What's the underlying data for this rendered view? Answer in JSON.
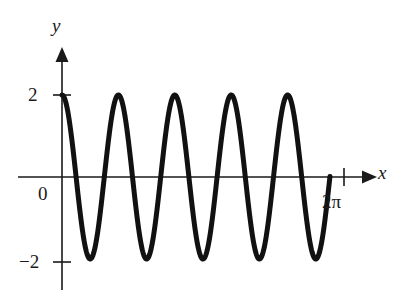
{
  "figure": {
    "axis_labels": {
      "x": "x",
      "y": "y"
    },
    "tick_labels": {
      "y_top": "2",
      "y_bottom": "−2",
      "origin": "0",
      "x_right": "2π"
    }
  },
  "chart_data": {
    "type": "line",
    "title": "",
    "subtitle": "",
    "xlabel": "x",
    "ylabel": "y",
    "xlim": [
      0,
      7.33
    ],
    "ylim": [
      -2.6,
      2.8
    ],
    "grid": false,
    "legend": null,
    "axis_style": "arrow-axes",
    "x_ticks": [
      6.2832
    ],
    "x_tick_labels": [
      "2π"
    ],
    "y_ticks": [
      2,
      0,
      -2
    ],
    "y_tick_labels": [
      "2",
      "0",
      "−2"
    ],
    "series": [
      {
        "name": "y = 2 cos(5x)",
        "amplitude": 2,
        "frequency": 5,
        "phase": 0,
        "x_start": 0,
        "x_end": 5.65,
        "line_color": "#111111",
        "line_width": 5,
        "x": [
          0.0,
          0.1885,
          0.377,
          0.5655,
          0.754,
          0.9425,
          1.131,
          1.3195,
          1.508,
          1.6965,
          1.885,
          2.0735,
          2.262,
          2.4504,
          2.6389,
          2.8274,
          3.0159,
          3.2044,
          3.3929,
          3.5814,
          3.7699,
          3.9584,
          4.1469,
          4.3354,
          4.5239,
          4.7124,
          4.9009,
          5.0894,
          5.2779,
          5.4664,
          5.6549
        ],
        "y": [
          2.0,
          1.618,
          0.618,
          -0.618,
          -1.618,
          -2.0,
          -1.618,
          -0.618,
          0.618,
          1.618,
          2.0,
          1.618,
          0.618,
          -0.618,
          -1.618,
          -2.0,
          -1.618,
          -0.618,
          0.618,
          1.618,
          2.0,
          1.618,
          0.618,
          -0.618,
          -1.618,
          -2.0,
          -1.618,
          -0.618,
          0.618,
          1.618,
          2.0
        ],
        "peaks_x": [
          0.0,
          1.885,
          3.7699,
          5.6549
        ],
        "peaks_y": [
          2,
          2,
          2,
          2
        ],
        "troughs_x": [
          0.9425,
          2.8274,
          4.7124
        ],
        "troughs_y": [
          -2,
          -2,
          -2
        ],
        "zero_crossings_x": [
          0.3142,
          0.9425,
          1.2566,
          1.885,
          2.1991,
          2.8274,
          3.1416,
          3.7699,
          4.0841,
          4.7124,
          5.0265
        ],
        "end_point_x": 5.97,
        "end_point_y": 1.3,
        "note": "curve terminates before x = 2π on a descending branch"
      }
    ]
  }
}
